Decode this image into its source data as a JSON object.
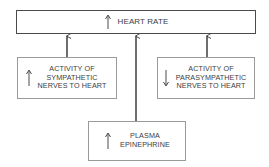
{
  "diagram": {
    "target": {
      "label": "HEART RATE",
      "direction": "increase"
    },
    "factors": [
      {
        "id": "sympathetic",
        "lines": [
          "ACTIVITY OF",
          "SYMPATHETIC",
          "NERVES TO HEART"
        ],
        "direction": "increase"
      },
      {
        "id": "parasympathetic",
        "lines": [
          "ACTIVITY OF",
          "PARASYMPATHETIC",
          "NERVES TO HEART"
        ],
        "direction": "decrease"
      },
      {
        "id": "epinephrine",
        "lines": [
          "PLASMA",
          "EPINEPHRINE"
        ],
        "direction": "increase"
      }
    ],
    "colors": {
      "line": "#4a4a4a",
      "text": "#3c3c3c",
      "background": "#ffffff"
    }
  }
}
